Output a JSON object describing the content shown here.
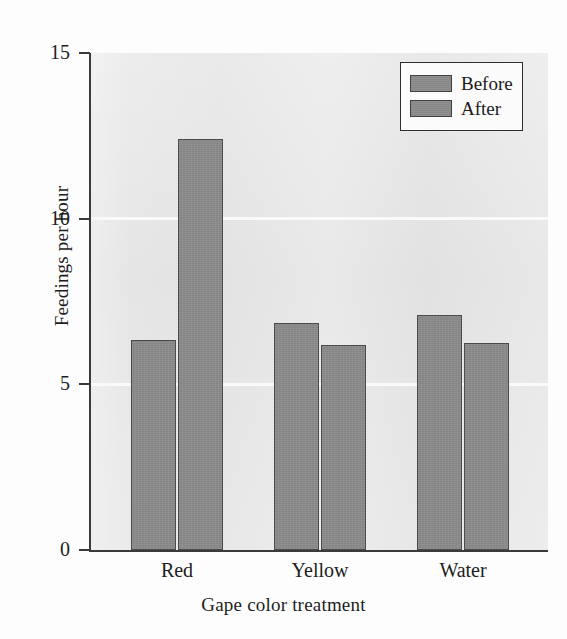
{
  "chart_data": {
    "type": "bar",
    "title": "",
    "xlabel": "Gape color treatment",
    "ylabel": "Feedings per hour",
    "categories": [
      "Red",
      "Yellow",
      "Water"
    ],
    "series": [
      {
        "name": "Before",
        "values": [
          6.35,
          6.85,
          7.1
        ]
      },
      {
        "name": "After",
        "values": [
          12.4,
          6.2,
          6.25
        ]
      }
    ],
    "ylim": [
      0,
      15
    ],
    "yticks": [
      0,
      5,
      10,
      15
    ],
    "ytick_labels": [
      "0",
      "5",
      "10",
      "15"
    ],
    "grid": "horizontal-white",
    "legend_position": "top-right",
    "colors": {
      "bar_fill": "#8a8a8a",
      "bar_edge": "#4a4a4a",
      "plot_background": "#e8e8e8",
      "gridline": "#fbfbfb",
      "axis": "#3a3a3a",
      "text": "#1d1d1d"
    }
  },
  "legend": {
    "entries": [
      {
        "label": "Before"
      },
      {
        "label": "After"
      }
    ]
  }
}
